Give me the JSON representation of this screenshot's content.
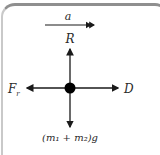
{
  "diagram": {
    "acceleration_label": "a",
    "up_force_label": "R",
    "left_force_label": "F",
    "left_force_subscript": "r",
    "right_force_label": "D",
    "down_force_label": "(m₁ + m₂)g",
    "colors": {
      "arrow": "#1a1a1a",
      "dot": "#000000",
      "frame_top": "#8f8f8f",
      "text": "#2a2a2a"
    }
  }
}
